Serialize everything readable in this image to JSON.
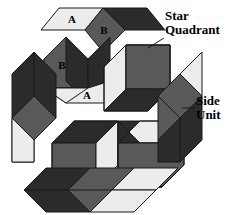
{
  "figure": {
    "background": "#ffffff",
    "width": 235,
    "height": 215,
    "palette": {
      "light": "#ececec",
      "medium": "#595959",
      "dark": "#2b2b2b",
      "outline": "#1a1a1a",
      "label_color": "#000000"
    }
  },
  "annotations": {
    "star_quadrant": {
      "text": "Star\nQuadrant",
      "leader": "leader-line-star-quadrant"
    },
    "side_unit": {
      "text": "Side\nUnit",
      "leader": "leader-line-side-unit"
    }
  },
  "piece_labels": {
    "a_top": "A",
    "b_top": "B",
    "b_left": "B",
    "a_left": "A"
  },
  "star_quadrants": [
    {
      "name": "top-star-quadrant",
      "faces": [
        {
          "role": "left-face",
          "shade": "light",
          "label": "A"
        },
        {
          "role": "front-face",
          "shade": "medium",
          "label": "B"
        },
        {
          "role": "right-face",
          "shade": "dark",
          "label": ""
        }
      ]
    },
    {
      "name": "left-star-quadrant",
      "faces": [
        {
          "role": "top-face",
          "shade": "medium",
          "label": "B"
        },
        {
          "role": "right-face",
          "shade": "dark",
          "label": ""
        },
        {
          "role": "bottom-face",
          "shade": "light",
          "label": "A"
        }
      ]
    },
    {
      "name": "right-star-quadrant",
      "faces": [
        {
          "role": "left-face",
          "shade": "light",
          "label": ""
        },
        {
          "role": "top-face",
          "shade": "medium",
          "label": ""
        },
        {
          "role": "bottom-face",
          "shade": "dark",
          "label": ""
        }
      ]
    },
    {
      "name": "bottom-left-star-quadrant",
      "faces": [
        {
          "role": "top-face",
          "shade": "dark",
          "label": ""
        },
        {
          "role": "left-face",
          "shade": "medium",
          "label": ""
        },
        {
          "role": "right-face",
          "shade": "light",
          "label": ""
        }
      ]
    },
    {
      "name": "bottom-right-star-quadrant",
      "faces": [
        {
          "role": "top-face",
          "shade": "light",
          "label": ""
        },
        {
          "role": "left-face",
          "shade": "dark",
          "label": ""
        },
        {
          "role": "right-face",
          "shade": "medium",
          "label": ""
        }
      ]
    }
  ],
  "side_units": [
    {
      "name": "left-side-unit",
      "orientation": "vertical",
      "rhombi": [
        "dark",
        "medium",
        "light"
      ]
    },
    {
      "name": "right-side-unit",
      "orientation": "vertical",
      "rhombi": [
        "light",
        "medium",
        "dark"
      ]
    },
    {
      "name": "bottom-side-unit",
      "orientation": "horizontal",
      "rhombi": [
        "dark",
        "medium",
        "light"
      ]
    }
  ]
}
